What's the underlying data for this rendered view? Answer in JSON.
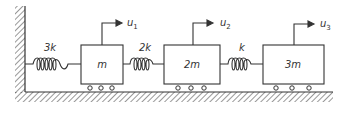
{
  "diagram": {
    "type": "spring-mass system",
    "springs": [
      {
        "label": "3k",
        "from": "wall",
        "to": "m"
      },
      {
        "label": "2k",
        "from": "m",
        "to": "2m"
      },
      {
        "label": "k",
        "from": "2m",
        "to": "3m"
      }
    ],
    "masses": [
      {
        "label": "m",
        "displacement": "u",
        "displacement_sub": "1"
      },
      {
        "label": "2m",
        "displacement": "u",
        "displacement_sub": "2"
      },
      {
        "label": "3m",
        "displacement": "u",
        "displacement_sub": "3"
      }
    ],
    "colors": {
      "line": "#333333",
      "background": "#ffffff"
    }
  }
}
